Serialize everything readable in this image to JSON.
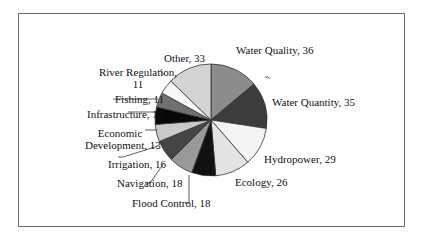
{
  "chart_data": {
    "type": "pie",
    "title": "",
    "categories": [
      "Water Quality",
      "Water Quantity",
      "Hydropower",
      "Ecology",
      "Flood Control",
      "Navigation",
      "Irrigation",
      "Economic Development",
      "Infrastructure",
      "Fishing",
      "River Regulation",
      "Other"
    ],
    "values": [
      36,
      35,
      29,
      26,
      18,
      18,
      16,
      13,
      13,
      11,
      11,
      33
    ],
    "colors": [
      "#8c8c8c",
      "#3c3c3c",
      "#f4f4f4",
      "#e4e4e4",
      "#111111",
      "#9a9a9a",
      "#454545",
      "#c9c9c9",
      "#080808",
      "#707070",
      "#f7f7f7",
      "#d4d4d4"
    ],
    "start_angle": "12 o'clock",
    "direction": "clockwise",
    "legend": "none (data labels with leader lines)"
  },
  "labels": {
    "water_quality": "Water Quality, 36",
    "water_quantity": "Water Quantity, 35",
    "hydropower": "Hydropower, 29",
    "ecology": "Ecology, 26",
    "flood_control": "Flood Control, 18",
    "navigation": "Navigation, 18",
    "irrigation": "Irrigation, 16",
    "econ_line1": "Economic",
    "econ_line2": "Development, 13",
    "infrastructure": "Infrastructure, 13",
    "fishing": "Fishing, 11",
    "river_line1": "River Regulation,",
    "river_line2": "11",
    "other": "Other, 33"
  }
}
